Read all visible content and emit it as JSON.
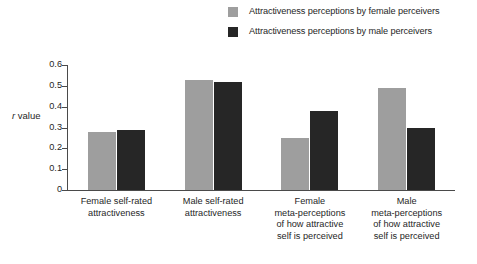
{
  "chart_data": {
    "type": "bar",
    "title": "",
    "xlabel": "",
    "ylabel": "r value",
    "ylim": [
      0,
      0.6
    ],
    "ytick_values": [
      "0.6",
      "0.5",
      "0.4",
      "0.3",
      "0.2",
      "0.1",
      "0"
    ],
    "grid": false,
    "legend_position": "top-right",
    "categories": [
      "Female self-rated attractiveness",
      "Male self-rated attractiveness",
      "Female meta-perceptions of how attractive self is perceived",
      "Male meta-perceptions of how attractive self is perceived"
    ],
    "category_lines": [
      [
        "Female self-rated",
        "attractiveness"
      ],
      [
        "Male self-rated",
        "attractiveness"
      ],
      [
        "Female",
        "meta-perceptions",
        "of how attractive",
        "self is perceived"
      ],
      [
        "Male",
        "meta-perceptions",
        "of how attractive",
        "self is perceived"
      ]
    ],
    "series": [
      {
        "name": "Attractiveness perceptions by female perceivers",
        "color": "#9e9e9e",
        "values": [
          0.28,
          0.53,
          0.25,
          0.49
        ]
      },
      {
        "name": "Attractiveness perceptions by male perceivers",
        "color": "#262626",
        "values": [
          0.29,
          0.52,
          0.38,
          0.3
        ]
      }
    ]
  },
  "legend": {
    "items": [
      {
        "label": "Attractiveness perceptions by female perceivers",
        "color": "#9e9e9e"
      },
      {
        "label": "Attractiveness perceptions by male perceivers",
        "color": "#262626"
      }
    ]
  },
  "axes": {
    "y_title_prefix": "r",
    "y_title_suffix": " value",
    "y_ticks": [
      "0.6",
      "0.5",
      "0.4",
      "0.3",
      "0.2",
      "0.1",
      "0"
    ]
  }
}
